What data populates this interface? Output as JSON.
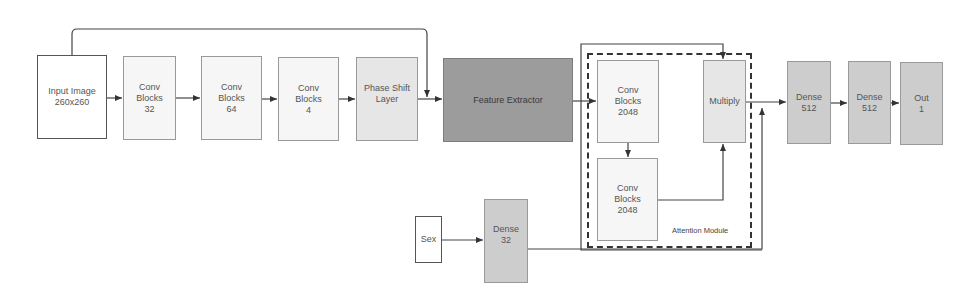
{
  "diagram": {
    "nodes": [
      {
        "id": "input",
        "label": "Input Image\n260x260",
        "style": "white"
      },
      {
        "id": "conv32",
        "label": "Conv\nBlocks\n32",
        "style": "pale"
      },
      {
        "id": "conv64",
        "label": "Conv\nBlocks\n64",
        "style": "pale"
      },
      {
        "id": "conv4",
        "label": "Conv\nBlocks\n4",
        "style": "pale"
      },
      {
        "id": "phase",
        "label": "Phase Shift\nLayer",
        "style": "light"
      },
      {
        "id": "feature",
        "label": "Feature Extractor",
        "style": "dark"
      },
      {
        "id": "conv2048a",
        "label": "Conv\nBlocks\n2048",
        "style": "pale"
      },
      {
        "id": "conv2048b",
        "label": "Conv\nBlocks\n2048",
        "style": "pale"
      },
      {
        "id": "multiply",
        "label": "Multiply",
        "style": "light"
      },
      {
        "id": "sex",
        "label": "Sex",
        "style": "white"
      },
      {
        "id": "dense32",
        "label": "Dense\n32",
        "style": "mid"
      },
      {
        "id": "dense512a",
        "label": "Dense\n512",
        "style": "mid"
      },
      {
        "id": "dense512b",
        "label": "Dense\n512",
        "style": "mid"
      },
      {
        "id": "out",
        "label": "Out\n1",
        "style": "mid"
      }
    ],
    "groups": [
      {
        "id": "attention",
        "label": "Attention Module",
        "border": "dashed"
      }
    ],
    "edges": [
      {
        "from": "input",
        "to": "conv32"
      },
      {
        "from": "conv32",
        "to": "conv64"
      },
      {
        "from": "conv64",
        "to": "conv4"
      },
      {
        "from": "conv4",
        "to": "phase"
      },
      {
        "from": "phase",
        "to": "feature"
      },
      {
        "from": "input",
        "to": "feature",
        "type": "skip"
      },
      {
        "from": "feature",
        "to": "conv2048a"
      },
      {
        "from": "feature",
        "to": "multiply",
        "type": "skip"
      },
      {
        "from": "conv2048a",
        "to": "conv2048b"
      },
      {
        "from": "conv2048b",
        "to": "multiply"
      },
      {
        "from": "multiply",
        "to": "dense512a"
      },
      {
        "from": "sex",
        "to": "dense32"
      },
      {
        "from": "dense32",
        "to": "dense512a",
        "type": "concat"
      },
      {
        "from": "dense512a",
        "to": "dense512b"
      },
      {
        "from": "dense512b",
        "to": "out"
      }
    ]
  }
}
